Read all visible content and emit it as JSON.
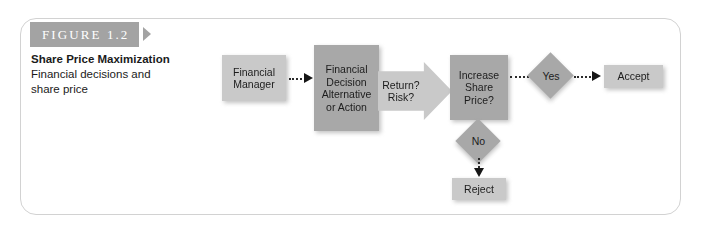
{
  "figure": {
    "banner_label": "FIGURE 1.2",
    "caption_title": "Share Price Maximization",
    "caption_line1": "Financial decisions and",
    "caption_line2": "share price"
  },
  "colors": {
    "banner_background": "#a3a3a3",
    "node_light": "#c9c9c9",
    "node_dark": "#a8a8a8",
    "frame_border": "#d2d2d2",
    "text": "#1c1c1c",
    "connector": "#2b2b2b"
  },
  "flowchart": {
    "nodes": {
      "financial_manager": {
        "line1": "Financial",
        "line2": "Manager"
      },
      "financial_decision": {
        "line1": "Financial",
        "line2": "Decision",
        "line3": "Alternative",
        "line4": "or Action"
      },
      "return_risk": {
        "line1": "Return?",
        "line2": "Risk?"
      },
      "increase_share_price": {
        "line1": "Increase",
        "line2": "Share",
        "line3": "Price?"
      },
      "yes_decision": {
        "label": "Yes"
      },
      "no_decision": {
        "label": "No"
      },
      "accept": {
        "label": "Accept"
      },
      "reject": {
        "label": "Reject"
      }
    }
  }
}
